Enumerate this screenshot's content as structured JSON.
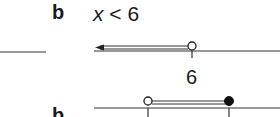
{
  "section_a": {
    "label": "b",
    "inequality": {
      "variable": "x",
      "operator": "<",
      "value": "6"
    },
    "number_line": {
      "point": {
        "value": "6",
        "type": "open"
      },
      "direction": "left",
      "tick_label": "6"
    }
  },
  "section_b": {
    "label": "b",
    "number_line": {
      "left_point": {
        "type": "open"
      },
      "right_point": {
        "type": "closed"
      }
    }
  }
}
